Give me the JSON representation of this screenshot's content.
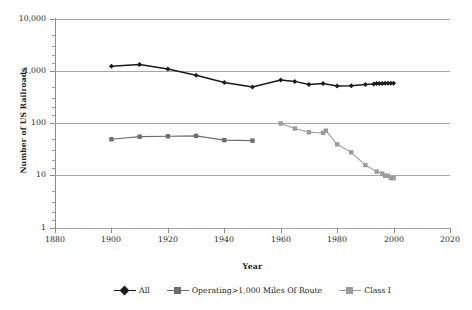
{
  "chart_data": {
    "type": "line",
    "title": "",
    "xlabel": "Year",
    "ylabel": "Number of US Railroads",
    "xlim": [
      1880,
      2020
    ],
    "ylim": [
      1,
      10000
    ],
    "yscale": "log",
    "grid": true,
    "legend_position": "bottom",
    "xticks": [
      "1880",
      "1900",
      "1920",
      "1940",
      "1960",
      "1980",
      "2000",
      "2020"
    ],
    "yticks": [
      "1",
      "10",
      "100",
      "1,000",
      "10,000"
    ],
    "series": [
      {
        "name": "All",
        "color": "#1a1a1a",
        "marker": "diamond",
        "x": [
          1900,
          1910,
          1920,
          1930,
          1940,
          1950,
          1960,
          1965,
          1970,
          1975,
          1980,
          1985,
          1990,
          1993,
          1994,
          1995,
          1996,
          1997,
          1998,
          1999,
          2000
        ],
        "values": [
          1250,
          1350,
          1100,
          840,
          610,
          500,
          680,
          640,
          560,
          580,
          520,
          530,
          560,
          570,
          580,
          580,
          585,
          590,
          590,
          590,
          590
        ]
      },
      {
        "name": "Operating>1,000 Miles Of Route",
        "color": "#6d6d6d",
        "marker": "square",
        "x": [
          1900,
          1910,
          1920,
          1930,
          1940,
          1950
        ],
        "values": [
          50,
          56,
          57,
          58,
          48,
          47
        ]
      },
      {
        "name": "Class I",
        "color": "#9b9b9b",
        "marker": "square",
        "x": [
          1960,
          1965,
          1970,
          1975,
          1976,
          1980,
          1985,
          1990,
          1994,
          1996,
          1997,
          1998,
          1999,
          2000
        ],
        "values": [
          100,
          80,
          68,
          66,
          73,
          40,
          28,
          16,
          12,
          11,
          10,
          10,
          9,
          9
        ]
      }
    ]
  },
  "axes": {
    "ylabel": "Number of US Railroads",
    "xlabel": "Year"
  },
  "legend": {
    "items": [
      {
        "label": "All",
        "color": "#1a1a1a",
        "marker": "diamond"
      },
      {
        "label": "Operating>1,000 Miles Of Route",
        "color": "#6d6d6d",
        "marker": "square"
      },
      {
        "label": "Class I",
        "color": "#9b9b9b",
        "marker": "square"
      }
    ]
  }
}
